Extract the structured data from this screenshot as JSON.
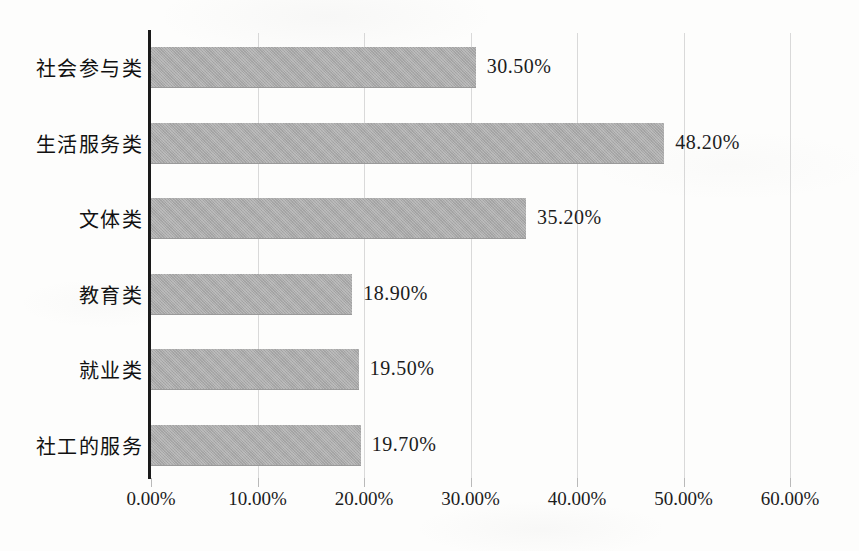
{
  "chart_data": {
    "type": "bar",
    "orientation": "horizontal",
    "title": "",
    "xlabel": "",
    "ylabel": "",
    "xlim": [
      0,
      60
    ],
    "grid": true,
    "legend": false,
    "categories": [
      "社会参与类",
      "生活服务类",
      "文体类",
      "教育类",
      "就业类",
      "社工的服务"
    ],
    "values": [
      30.5,
      48.2,
      35.2,
      18.9,
      19.5,
      19.7
    ],
    "value_labels": [
      "30.50%",
      "48.20%",
      "35.20%",
      "18.90%",
      "19.50%",
      "19.70%"
    ],
    "xticks": [
      0,
      10,
      20,
      30,
      40,
      50,
      60
    ],
    "xtick_labels": [
      "0.00%",
      "10.00%",
      "20.00%",
      "30.00%",
      "40.00%",
      "50.00%",
      "60.00%"
    ],
    "bar_color": "#a9a9a9",
    "axis_color": "#1a1a1a",
    "gridline_color": "#d9d9d9",
    "background_color": "#fdfdfc"
  }
}
